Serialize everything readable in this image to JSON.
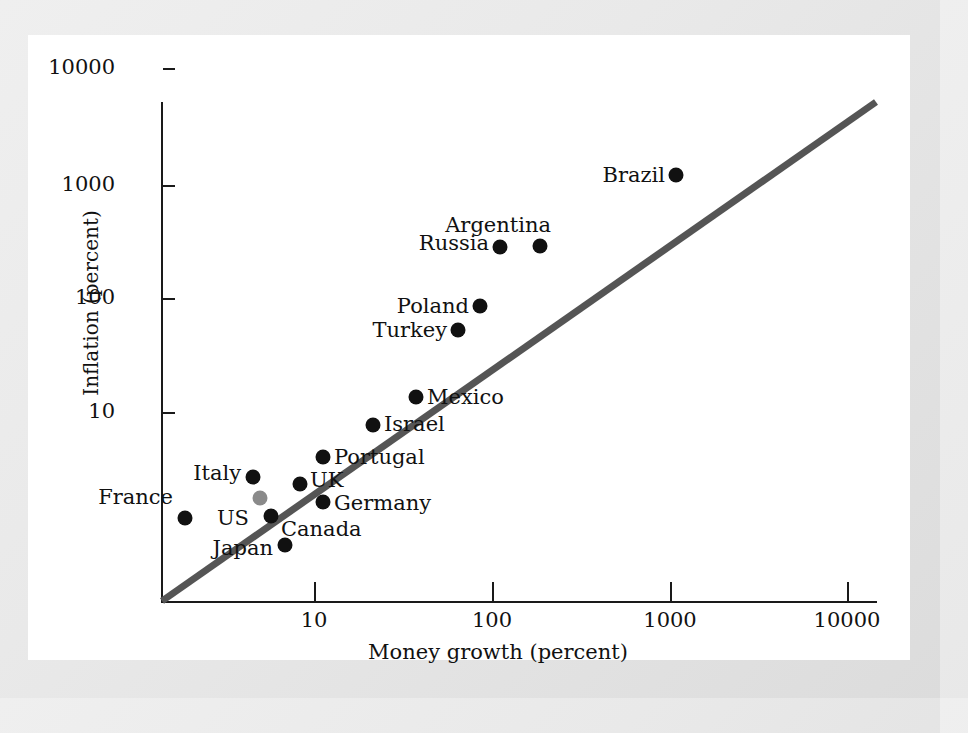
{
  "chart_data": {
    "type": "scatter",
    "title": "",
    "xlabel": "Money growth (percent)",
    "ylabel": "Inflation (percent)",
    "xscale": "log",
    "yscale": "log",
    "xticks": [
      "10",
      "100",
      "1000",
      "10000"
    ],
    "yticks": [
      "10",
      "100",
      "1000",
      "10000"
    ],
    "xlim": [
      2.2,
      10000
    ],
    "ylim": [
      2.2,
      10000
    ],
    "grid": false,
    "legend": null,
    "annotation_line": {
      "name": "45-degree line",
      "color": "#555555",
      "from": [
        2.2,
        2.2
      ],
      "to": [
        10000,
        10000
      ]
    },
    "points": [
      {
        "label": "France",
        "x": 3.1,
        "y": 2.9,
        "px": 185,
        "py": 518,
        "lx": 173,
        "ly": 497,
        "side": "left",
        "color": "#111111"
      },
      {
        "label": "Italy",
        "x": 5.6,
        "y": 5.6,
        "px": 253,
        "py": 477,
        "lx": 241,
        "ly": 473,
        "side": "left",
        "color": "#111111"
      },
      {
        "label": "US",
        "x": 6.2,
        "y": 4.2,
        "px": 260,
        "py": 498,
        "lx": 249,
        "ly": 518,
        "side": "left",
        "color": "#8a8a8a"
      },
      {
        "label": "Canada",
        "x": 6.9,
        "y": 3.3,
        "px": 271,
        "py": 516,
        "lx": 281,
        "ly": 529,
        "side": "right",
        "color": "#111111"
      },
      {
        "label": "Japan",
        "x": 8.2,
        "y": 2.4,
        "px": 285,
        "py": 545,
        "lx": 273,
        "ly": 548,
        "side": "left",
        "color": "#111111"
      },
      {
        "label": "UK",
        "x": 10.2,
        "y": 4.6,
        "px": 300,
        "py": 484,
        "lx": 310,
        "ly": 480,
        "side": "right",
        "color": "#111111"
      },
      {
        "label": "Portugal",
        "x": 11.8,
        "y": 8.4,
        "px": 323,
        "py": 457,
        "lx": 334,
        "ly": 457,
        "side": "right",
        "color": "#111111"
      },
      {
        "label": "Germany",
        "x": 11.8,
        "y": 3.8,
        "px": 323,
        "py": 502,
        "lx": 334,
        "ly": 503,
        "side": "right",
        "color": "#111111"
      },
      {
        "label": "Israel",
        "x": 22.0,
        "y": 13.0,
        "px": 373,
        "py": 425,
        "lx": 384,
        "ly": 424,
        "side": "right",
        "color": "#111111"
      },
      {
        "label": "Mexico",
        "x": 37.0,
        "y": 23.0,
        "px": 416,
        "py": 397,
        "lx": 427,
        "ly": 397,
        "side": "right",
        "color": "#111111"
      },
      {
        "label": "Turkey",
        "x": 63.0,
        "y": 79.0,
        "px": 458,
        "py": 330,
        "lx": 447,
        "ly": 330,
        "side": "left",
        "color": "#111111"
      },
      {
        "label": "Poland",
        "x": 75.0,
        "y": 120.0,
        "px": 480,
        "py": 306,
        "lx": 469,
        "ly": 306,
        "side": "left",
        "color": "#111111"
      },
      {
        "label": "Russia",
        "x": 110.0,
        "y": 370.0,
        "px": 500,
        "py": 247,
        "lx": 489,
        "ly": 243,
        "side": "left",
        "color": "#111111"
      },
      {
        "label": "Argentina",
        "x": 180.0,
        "y": 370.0,
        "px": 540,
        "py": 246,
        "lx": 551,
        "ly": 225,
        "side": "left",
        "color": "#111111"
      },
      {
        "label": "Brazil",
        "x": 1150.0,
        "y": 1300.0,
        "px": 676,
        "py": 175,
        "lx": 665,
        "ly": 175,
        "side": "left",
        "color": "#111111"
      }
    ]
  },
  "axis": {
    "y_ticks": [
      {
        "label": "10000",
        "py": 68
      },
      {
        "label": "1000",
        "py": 185
      },
      {
        "label": "100",
        "py": 298
      },
      {
        "label": "10",
        "py": 412
      }
    ],
    "x_ticks": [
      {
        "label": "10",
        "px": 314
      },
      {
        "label": "100",
        "px": 492
      },
      {
        "label": "1000",
        "px": 670
      },
      {
        "label": "10000",
        "px": 847
      }
    ]
  }
}
